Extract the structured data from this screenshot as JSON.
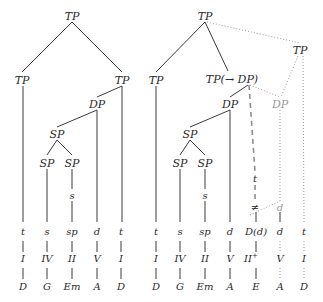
{
  "figure": {
    "trees": [
      {
        "id": "left-tree",
        "root": "TP",
        "nodes": [
          {
            "name": "root-tp",
            "label": "TP",
            "x": 72,
            "y": 16
          },
          {
            "name": "left-tp",
            "label": "TP",
            "x": 22,
            "y": 80
          },
          {
            "name": "right-tp",
            "label": "TP",
            "x": 122,
            "y": 80
          },
          {
            "name": "dp",
            "label": "DP",
            "x": 97,
            "y": 104
          },
          {
            "name": "sp-upper",
            "label": "SP",
            "x": 57,
            "y": 134
          },
          {
            "name": "sp-left",
            "label": "SP",
            "x": 47,
            "y": 163
          },
          {
            "name": "sp-right",
            "label": "SP",
            "x": 72,
            "y": 163
          },
          {
            "name": "s-node",
            "label": "s",
            "x": 72,
            "y": 196
          }
        ],
        "columns": [
          {
            "name": "col-1",
            "x": 23,
            "function": "t",
            "numeral": "I",
            "chord": "D"
          },
          {
            "name": "col-2",
            "x": 47,
            "function": "s",
            "numeral": "IV",
            "chord": "G"
          },
          {
            "name": "col-3",
            "x": 72,
            "function": "sp",
            "numeral": "II",
            "chord": "Em"
          },
          {
            "name": "col-4",
            "x": 97,
            "function": "d",
            "numeral": "V",
            "chord": "A"
          },
          {
            "name": "col-5",
            "x": 121,
            "function": "t",
            "numeral": "I",
            "chord": "D"
          }
        ]
      },
      {
        "id": "right-tree",
        "root": "TP",
        "nodes": [
          {
            "name": "root-tp",
            "label": "TP",
            "x": 205,
            "y": 16
          },
          {
            "name": "upper-right-tp",
            "label": "TP",
            "x": 300,
            "y": 50
          },
          {
            "name": "left-tp",
            "label": "TP",
            "x": 156,
            "y": 80
          },
          {
            "name": "tp-arrow-dp",
            "label": "TP(→ DP)",
            "x": 232,
            "y": 79
          },
          {
            "name": "dp-left",
            "label": "DP",
            "x": 230,
            "y": 104
          },
          {
            "name": "dp-right",
            "label": "DP",
            "x": 280,
            "y": 104
          },
          {
            "name": "sp-upper",
            "label": "SP",
            "x": 190,
            "y": 134
          },
          {
            "name": "sp-left",
            "label": "SP",
            "x": 180,
            "y": 163
          },
          {
            "name": "sp-right",
            "label": "SP",
            "x": 205,
            "y": 163
          },
          {
            "name": "s-node",
            "label": "s",
            "x": 205,
            "y": 196
          },
          {
            "name": "t-node",
            "label": "t",
            "x": 255,
            "y": 180
          },
          {
            "name": "neq-node",
            "label": "≠",
            "x": 255,
            "y": 208
          },
          {
            "name": "d-node",
            "label": "d",
            "x": 280,
            "y": 208
          }
        ],
        "columns": [
          {
            "name": "col-1",
            "x": 156,
            "function": "t",
            "numeral": "I",
            "sup": "",
            "chord": "D",
            "style": "solid"
          },
          {
            "name": "col-2",
            "x": 180,
            "function": "s",
            "numeral": "IV",
            "sup": "",
            "chord": "G",
            "style": "solid"
          },
          {
            "name": "col-3",
            "x": 205,
            "function": "sp",
            "numeral": "II",
            "sup": "",
            "chord": "Em",
            "style": "solid"
          },
          {
            "name": "col-4",
            "x": 230,
            "function": "d",
            "numeral": "V",
            "sup": "",
            "chord": "A",
            "style": "solid"
          },
          {
            "name": "col-5",
            "x": 256,
            "function": "D(d)",
            "numeral": "II",
            "sup": "+",
            "chord": "E",
            "style": "solid"
          },
          {
            "name": "col-6",
            "x": 280,
            "function": "d",
            "numeral": "V",
            "sup": "",
            "chord": "A",
            "style": "dotted"
          },
          {
            "name": "col-7",
            "x": 304,
            "function": "t",
            "numeral": "I",
            "sup": "",
            "chord": "D",
            "style": "dotted"
          }
        ]
      }
    ],
    "rows": {
      "function_y": 232,
      "numeral_y": 259,
      "chord_y": 287
    },
    "colors": {
      "ink": "#2b2b2b",
      "solid_line": "#3a3a3a",
      "faint_line": "#9a9a9a",
      "dashed_line": "#8d8d8d",
      "background": "#ffffff"
    }
  }
}
